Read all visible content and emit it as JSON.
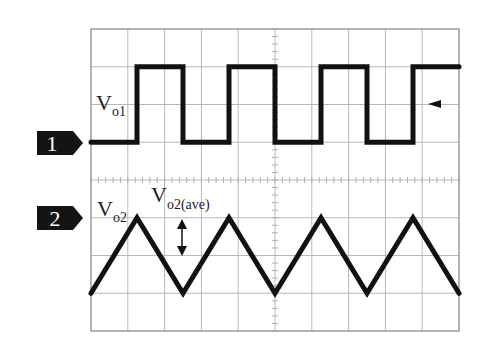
{
  "channels": [
    {
      "id": "1",
      "marker_label": "1",
      "signal_label_main": "V",
      "signal_label_sub": "o1",
      "waveform": "square"
    },
    {
      "id": "2",
      "marker_label": "2",
      "signal_label_main": "V",
      "signal_label_sub": "o2",
      "waveform": "triangle"
    }
  ],
  "annotation": {
    "main": "V",
    "sub": "o2(ave)",
    "symbol": "double-arrow-vertical"
  },
  "trigger_marker": {
    "symbol": "left-arrow"
  },
  "colors": {
    "trace": "#111111",
    "grid": "#b8b8b8",
    "marker": "#141414"
  },
  "chart_data": {
    "type": "line",
    "title": "",
    "grid": true,
    "x_divisions": 10,
    "y_divisions": 8,
    "xlim": [
      0,
      10
    ],
    "ylim": [
      0,
      8
    ],
    "series": [
      {
        "name": "Vo1",
        "shape": "square",
        "x": [
          0,
          1.25,
          1.25,
          2.5,
          2.5,
          3.75,
          3.75,
          5.0,
          5.0,
          6.25,
          6.25,
          7.5,
          7.5,
          8.75,
          8.75,
          10
        ],
        "y": [
          5,
          5,
          7,
          7,
          5,
          5,
          7,
          7,
          5,
          5,
          7,
          7,
          5,
          5,
          7,
          7
        ]
      },
      {
        "name": "Vo2",
        "shape": "triangle",
        "x": [
          0,
          1.25,
          2.5,
          3.75,
          5.0,
          6.25,
          7.5,
          8.75,
          10
        ],
        "y": [
          1,
          3,
          1,
          3,
          1,
          3,
          1,
          3,
          1
        ]
      }
    ]
  }
}
